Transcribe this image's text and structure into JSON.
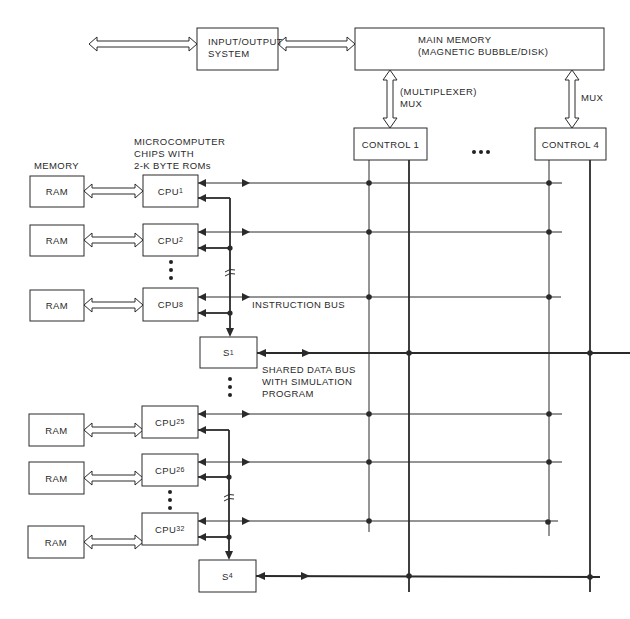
{
  "diagram": {
    "io_system": {
      "line1": "INPUT/OUTPUT",
      "line2": "SYSTEM"
    },
    "main_memory": {
      "line1": "MAIN MEMORY",
      "line2": "(MAGNETIC BUBBLE/DISK)"
    },
    "mux_left": {
      "line1": "(MULTIPLEXER)",
      "line2": "MUX"
    },
    "mux_right": {
      "label": "MUX"
    },
    "controls": [
      {
        "label": "CONTROL 1"
      },
      {
        "label": "CONTROL 4"
      }
    ],
    "memory_heading": "MEMORY",
    "cpu_heading": {
      "line1": "MICROCOMPUTER",
      "line2": "CHIPS WITH",
      "line3": "2-K BYTE ROMs"
    },
    "ram_label": "RAM",
    "cpus": [
      {
        "base": "CPU",
        "sub": "1"
      },
      {
        "base": "CPU",
        "sub": "2"
      },
      {
        "base": "CPU",
        "sub": "8"
      },
      {
        "base": "CPU",
        "sub": "25"
      },
      {
        "base": "CPU",
        "sub": "26"
      },
      {
        "base": "CPU",
        "sub": "32"
      }
    ],
    "switches": [
      {
        "base": "S",
        "sub": "1"
      },
      {
        "base": "S",
        "sub": "4"
      }
    ],
    "instruction_bus": "INSTRUCTION BUS",
    "shared_bus": {
      "line1": "SHARED DATA BUS",
      "line2": "WITH SIMULATION",
      "line3": "PROGRAM"
    },
    "colors": {
      "line": "#2a2a2a",
      "background": "#ffffff"
    }
  }
}
